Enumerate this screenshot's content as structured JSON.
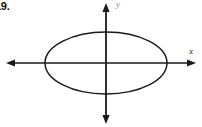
{
  "figure": {
    "problem_number": "19.",
    "background_color": "#ffffff",
    "stroke_color": "#1a1a1a",
    "x_axis_label": "x",
    "y_axis_label": "y"
  },
  "chart_data": {
    "type": "line",
    "title": "",
    "subtitle": "",
    "xlabel": "x",
    "ylabel": "y",
    "grid": false,
    "legend": null,
    "annotations": [],
    "shape": "ellipse",
    "center": [
      0,
      0
    ],
    "semi_major_axis_a": 61,
    "semi_minor_axis_b": 31,
    "orientation": "horizontal",
    "x_intercepts": [
      -61,
      61
    ],
    "y_intercepts": [
      -31,
      31
    ],
    "xlim": [
      -98,
      90
    ],
    "ylim": [
      -61,
      57
    ],
    "axes": {
      "x_axis": {
        "y_position": 63,
        "x_start": 6,
        "x_end": 196,
        "arrows": [
          "left",
          "right"
        ]
      },
      "y_axis": {
        "x_position": 106,
        "y_start": 3,
        "y_end": 124,
        "arrows": [
          "up",
          "down"
        ]
      }
    },
    "ellipse_pixels": {
      "center_x": 106,
      "center_y": 63,
      "radius_x": 61,
      "radius_y": 31,
      "left": 45,
      "right": 167,
      "top": 32,
      "bottom": 94
    }
  }
}
